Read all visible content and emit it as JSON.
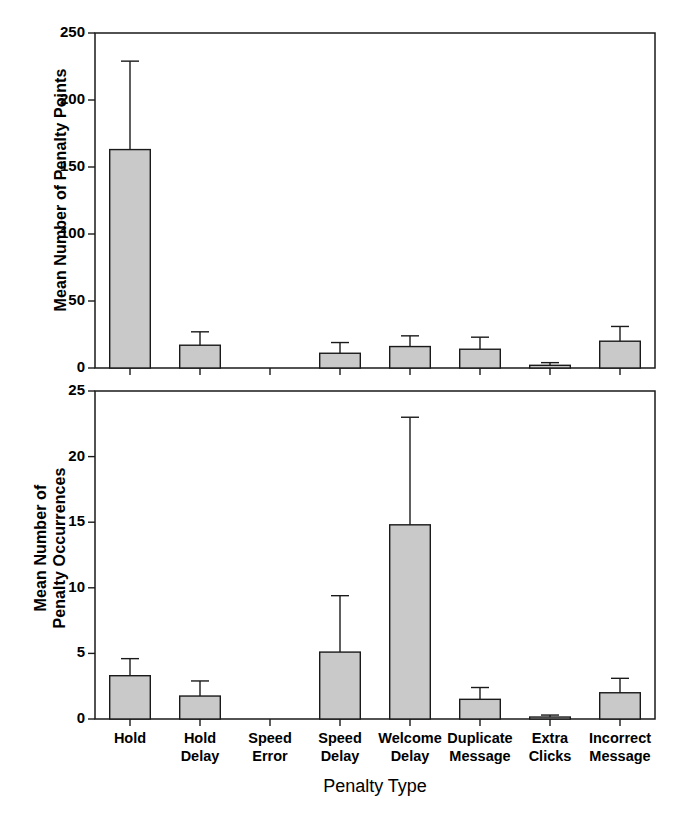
{
  "figure": {
    "width": 679,
    "height": 818,
    "background": "#ffffff",
    "bar_fill": "#c9c9c9",
    "bar_stroke": "#1a1a1a"
  },
  "xaxis_title": "Penalty Type",
  "categories": [
    "Hold",
    "Hold\nDelay",
    "Speed\nError",
    "Speed\nDelay",
    "Welcome\nDelay",
    "Duplicate\nMessage",
    "Extra\nClicks",
    "Incorrect\nMessage"
  ],
  "chart_data": [
    {
      "type": "bar",
      "panel": "top",
      "title": "",
      "xlabel": "",
      "ylabel": "Mean Number of Penalty Points",
      "ylim": [
        0,
        250
      ],
      "yticks": [
        0,
        50,
        100,
        150,
        200,
        250
      ],
      "ytick_labels": [
        "0",
        "50",
        "100",
        "150",
        "200",
        "250"
      ],
      "grid": false,
      "legend": "none",
      "categories": [
        "Hold",
        "Hold Delay",
        "Speed Error",
        "Speed Delay",
        "Welcome Delay",
        "Duplicate Message",
        "Extra Clicks",
        "Incorrect Message"
      ],
      "values": [
        163,
        17,
        0,
        11,
        16,
        14,
        2,
        20
      ],
      "errors": [
        66,
        10,
        0,
        8,
        8,
        9,
        2,
        11
      ],
      "error_type": "standard deviation (upper whisker only)"
    },
    {
      "type": "bar",
      "panel": "bottom",
      "title": "",
      "xlabel": "Penalty Type",
      "ylabel": "Mean Number of\nPenalty Occurrences",
      "ylim": [
        0,
        25
      ],
      "yticks": [
        0,
        5,
        10,
        15,
        20,
        25
      ],
      "ytick_labels": [
        "0",
        "5",
        "10",
        "15",
        "20",
        "25"
      ],
      "grid": false,
      "legend": "none",
      "categories": [
        "Hold",
        "Hold Delay",
        "Speed Error",
        "Speed Delay",
        "Welcome Delay",
        "Duplicate Message",
        "Extra Clicks",
        "Incorrect Message"
      ],
      "values": [
        3.3,
        1.75,
        0,
        5.1,
        14.8,
        1.5,
        0.15,
        2.0
      ],
      "errors": [
        1.3,
        1.15,
        0,
        4.3,
        8.2,
        0.9,
        0.15,
        1.1
      ],
      "error_type": "standard deviation (upper whisker only)"
    }
  ]
}
